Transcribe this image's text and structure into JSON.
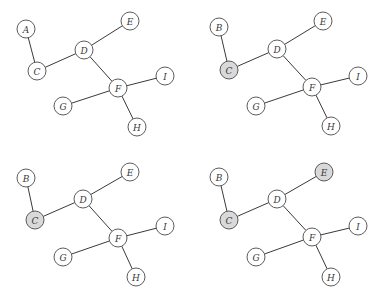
{
  "diagram": {
    "type": "graph-sequence",
    "panels": [
      {
        "id": "top-left",
        "offset": [
          0,
          0
        ],
        "nodes": [
          {
            "id": "A",
            "label": "A",
            "x": 26,
            "y": 29,
            "shaded": false
          },
          {
            "id": "C",
            "label": "C",
            "x": 37,
            "y": 71,
            "shaded": false
          },
          {
            "id": "D",
            "label": "D",
            "x": 84,
            "y": 50,
            "shaded": false
          },
          {
            "id": "E",
            "label": "E",
            "x": 130,
            "y": 21,
            "shaded": false
          },
          {
            "id": "F",
            "label": "F",
            "x": 118,
            "y": 88,
            "shaded": false
          },
          {
            "id": "G",
            "label": "G",
            "x": 63,
            "y": 106,
            "shaded": false
          },
          {
            "id": "H",
            "label": "H",
            "x": 137,
            "y": 127,
            "shaded": false
          },
          {
            "id": "I",
            "label": "I",
            "x": 165,
            "y": 76,
            "shaded": false
          }
        ],
        "edges": [
          [
            "A",
            "C"
          ],
          [
            "C",
            "D"
          ],
          [
            "D",
            "E"
          ],
          [
            "D",
            "F"
          ],
          [
            "F",
            "G"
          ],
          [
            "F",
            "H"
          ],
          [
            "F",
            "I"
          ]
        ]
      },
      {
        "id": "top-right",
        "offset": [
          0,
          0
        ],
        "nodes": [
          {
            "id": "B",
            "label": "B",
            "x": 219,
            "y": 27,
            "shaded": false
          },
          {
            "id": "C",
            "label": "C",
            "x": 229,
            "y": 70,
            "shaded": true
          },
          {
            "id": "D",
            "label": "D",
            "x": 277,
            "y": 49,
            "shaded": false
          },
          {
            "id": "E",
            "label": "E",
            "x": 323,
            "y": 21,
            "shaded": false
          },
          {
            "id": "F",
            "label": "F",
            "x": 312,
            "y": 87,
            "shaded": false
          },
          {
            "id": "G",
            "label": "G",
            "x": 256,
            "y": 106,
            "shaded": false
          },
          {
            "id": "H",
            "label": "H",
            "x": 331,
            "y": 126,
            "shaded": false
          },
          {
            "id": "I",
            "label": "I",
            "x": 358,
            "y": 76,
            "shaded": false
          }
        ],
        "edges": [
          [
            "B",
            "C"
          ],
          [
            "C",
            "D"
          ],
          [
            "D",
            "E"
          ],
          [
            "D",
            "F"
          ],
          [
            "F",
            "G"
          ],
          [
            "F",
            "H"
          ],
          [
            "F",
            "I"
          ]
        ]
      },
      {
        "id": "bottom-left",
        "offset": [
          0,
          0
        ],
        "nodes": [
          {
            "id": "B",
            "label": "B",
            "x": 26,
            "y": 178,
            "shaded": false
          },
          {
            "id": "C",
            "label": "C",
            "x": 35,
            "y": 220,
            "shaded": true
          },
          {
            "id": "D",
            "label": "D",
            "x": 83,
            "y": 199,
            "shaded": false
          },
          {
            "id": "E",
            "label": "E",
            "x": 130,
            "y": 172,
            "shaded": false
          },
          {
            "id": "F",
            "label": "F",
            "x": 118,
            "y": 238,
            "shaded": false
          },
          {
            "id": "G",
            "label": "G",
            "x": 63,
            "y": 257,
            "shaded": false
          },
          {
            "id": "H",
            "label": "H",
            "x": 136,
            "y": 277,
            "shaded": false
          },
          {
            "id": "I",
            "label": "I",
            "x": 165,
            "y": 226,
            "shaded": false
          }
        ],
        "edges": [
          [
            "B",
            "C"
          ],
          [
            "C",
            "D"
          ],
          [
            "D",
            "E"
          ],
          [
            "D",
            "F"
          ],
          [
            "F",
            "G"
          ],
          [
            "F",
            "H"
          ],
          [
            "F",
            "I"
          ]
        ]
      },
      {
        "id": "bottom-right",
        "offset": [
          0,
          0
        ],
        "nodes": [
          {
            "id": "B",
            "label": "B",
            "x": 219,
            "y": 177,
            "shaded": false
          },
          {
            "id": "C",
            "label": "C",
            "x": 229,
            "y": 220,
            "shaded": true
          },
          {
            "id": "D",
            "label": "D",
            "x": 277,
            "y": 199,
            "shaded": false
          },
          {
            "id": "E",
            "label": "E",
            "x": 324,
            "y": 172,
            "shaded": true
          },
          {
            "id": "F",
            "label": "F",
            "x": 312,
            "y": 237,
            "shaded": false
          },
          {
            "id": "G",
            "label": "G",
            "x": 256,
            "y": 257,
            "shaded": false
          },
          {
            "id": "H",
            "label": "H",
            "x": 331,
            "y": 277,
            "shaded": false
          },
          {
            "id": "I",
            "label": "I",
            "x": 358,
            "y": 226,
            "shaded": false
          }
        ],
        "edges": [
          [
            "B",
            "C"
          ],
          [
            "C",
            "D"
          ],
          [
            "D",
            "E"
          ],
          [
            "D",
            "F"
          ],
          [
            "F",
            "G"
          ],
          [
            "F",
            "H"
          ],
          [
            "F",
            "I"
          ]
        ]
      }
    ],
    "style": {
      "node_radius": 9,
      "stroke_color": "#4a4a4a",
      "edge_color": "#3a3a3a",
      "node_fill": "#ffffff",
      "shaded_fill": "#d9d9d9"
    }
  }
}
